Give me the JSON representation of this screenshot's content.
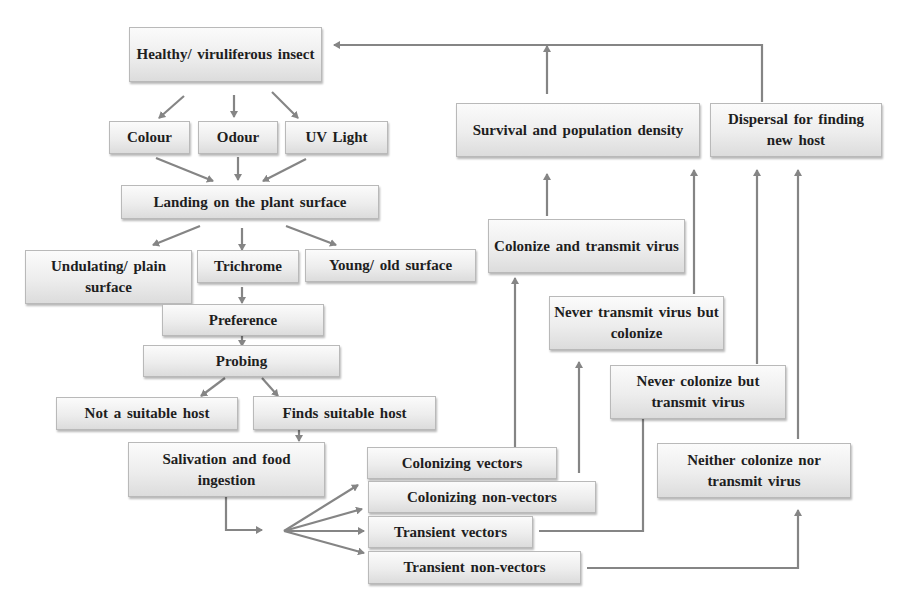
{
  "diagram": {
    "nodes": {
      "healthy_insect": "Healthy/ viruliferous insect",
      "colour": "Colour",
      "odour": "Odour",
      "uv_light": "UV Light",
      "landing": "Landing on the plant surface",
      "undulating": "Undulating/ plain surface",
      "trichrome": "Trichrome",
      "young_old": "Young/ old surface",
      "preference": "Preference",
      "probing": "Probing",
      "not_suitable": "Not a suitable host",
      "finds_suitable": "Finds suitable host",
      "salivation": "Salivation and food ingestion",
      "colonizing_vectors": "Colonizing vectors",
      "colonizing_non_vectors": "Colonizing non-vectors",
      "transient_vectors": "Transient vectors",
      "transient_non_vectors": "Transient non-vectors",
      "colonize_transmit": "Colonize and transmit virus",
      "never_transmit": "Never transmit virus but colonize",
      "never_colonize": "Never colonize but transmit virus",
      "neither": "Neither colonize nor transmit virus",
      "survival": "Survival and population density",
      "dispersal": "Dispersal for finding new host"
    },
    "edges": [
      [
        "healthy_insect",
        "colour"
      ],
      [
        "healthy_insect",
        "odour"
      ],
      [
        "healthy_insect",
        "uv_light"
      ],
      [
        "colour",
        "landing"
      ],
      [
        "odour",
        "landing"
      ],
      [
        "uv_light",
        "landing"
      ],
      [
        "landing",
        "undulating"
      ],
      [
        "landing",
        "trichrome"
      ],
      [
        "landing",
        "young_old"
      ],
      [
        "trichrome",
        "preference"
      ],
      [
        "preference",
        "probing"
      ],
      [
        "probing",
        "not_suitable"
      ],
      [
        "probing",
        "finds_suitable"
      ],
      [
        "finds_suitable",
        "salivation"
      ],
      [
        "salivation",
        "colonizing_vectors"
      ],
      [
        "salivation",
        "colonizing_non_vectors"
      ],
      [
        "salivation",
        "transient_vectors"
      ],
      [
        "salivation",
        "transient_non_vectors"
      ],
      [
        "colonizing_vectors",
        "colonize_transmit"
      ],
      [
        "colonizing_non_vectors",
        "never_transmit"
      ],
      [
        "transient_vectors",
        "never_colonize"
      ],
      [
        "transient_non_vectors",
        "neither"
      ],
      [
        "colonize_transmit",
        "survival"
      ],
      [
        "never_transmit",
        "survival"
      ],
      [
        "never_colonize",
        "dispersal"
      ],
      [
        "neither",
        "dispersal"
      ],
      [
        "survival",
        "healthy_insect"
      ],
      [
        "dispersal",
        "healthy_insect"
      ]
    ],
    "colors": {
      "line": "#858585",
      "box_border": "#b9b9b9",
      "text": "#1e1e1e"
    }
  }
}
